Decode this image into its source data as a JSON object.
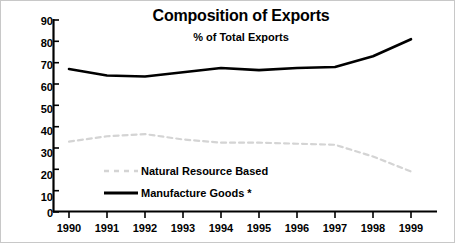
{
  "chart_data": {
    "type": "line",
    "title": "Composition of Exports",
    "subtitle": "% of Total Exports",
    "xlabel": "",
    "ylabel": "",
    "x": [
      1990,
      1991,
      1992,
      1993,
      1994,
      1995,
      1996,
      1997,
      1998,
      1999
    ],
    "categories": [
      "1990",
      "1991",
      "1992",
      "1993",
      "1994",
      "1995",
      "1996",
      "1997",
      "1998",
      "1999"
    ],
    "ylim": [
      0,
      90
    ],
    "yticks": [
      0,
      10,
      20,
      30,
      40,
      50,
      60,
      70,
      80,
      90
    ],
    "ytick_labels": [
      "0",
      "10",
      "20",
      "30",
      "40",
      "50",
      "60",
      "70",
      "80",
      "90"
    ],
    "grid": false,
    "legend_position": "inside-lower-left",
    "series": [
      {
        "name": "Natural Resource Based",
        "values": [
          33.0,
          35.5,
          36.5,
          34.0,
          32.5,
          32.5,
          32.0,
          31.5,
          26.0,
          19.0
        ],
        "style": "dashed",
        "color": "#d4d4d4",
        "width": 2.2
      },
      {
        "name": "Manufacture Goods *",
        "values": [
          67.0,
          64.0,
          63.5,
          65.5,
          67.5,
          66.5,
          67.5,
          68.0,
          73.0,
          81.0
        ],
        "style": "solid",
        "color": "#000000",
        "width": 2.6
      }
    ]
  },
  "legend": {
    "items": [
      {
        "label": "Natural Resource Based"
      },
      {
        "label": "Manufacture Goods *"
      }
    ]
  },
  "axes": {
    "axis_color": "#000000"
  }
}
